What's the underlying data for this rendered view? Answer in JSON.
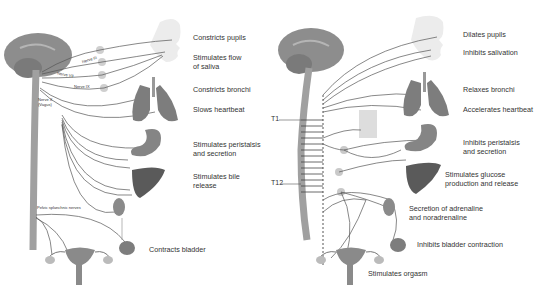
{
  "diagram": {
    "panels": [
      {
        "id": "parasympathetic",
        "effects": [
          "Constricts pupils",
          "Stimulates flow\nof saliva",
          "Constricts bronchi",
          "Slows heartbeat",
          "Stimulates peristalsis\nand secretion",
          "Stimulates bile\nrelease",
          "Contracts bladder"
        ],
        "nerves": {
          "n3": "Nerve III",
          "n7": "Nerve VII",
          "n9": "Nerve IX",
          "n10": "Nerve X\n(Vagus)",
          "pelvic": "Pelvic splanchnic nerves"
        }
      },
      {
        "id": "sympathetic",
        "effects": [
          "Dilates pupils",
          "Inhibits salivation",
          "Relaxes bronchi",
          "Accelerates heartbeat",
          "Inhibits peristalsis\nand secretion",
          "Stimulates glucose\nproduction and release",
          "Secretion of adrenaline\nand noradrenaline",
          "Inhibits bladder contraction",
          "Stimulates orgasm"
        ],
        "spinal_levels": {
          "t1": "T1",
          "t12": "T12"
        }
      }
    ],
    "colors": {
      "brain": "#8a8a8a",
      "organ": "#6f6f6f",
      "nerve_line": "#4a4a4a",
      "ganglion": "#c9c9c9",
      "spinal_cord": "#9a9a9a",
      "text": "#333333"
    }
  }
}
